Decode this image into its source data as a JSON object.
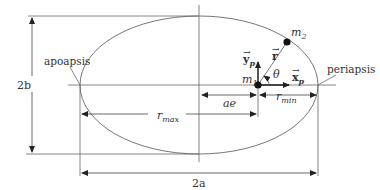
{
  "diagram": {
    "labels": {
      "apoapsis": "apoapsis",
      "periapsis": "periapsis",
      "two_b": "2b",
      "two_a": "2a",
      "ae": "ae",
      "r_max_base": "r",
      "r_max_sub": "max",
      "r_min_base": "r",
      "r_min_sub": "min",
      "m1_base": "m",
      "m1_sub": "1",
      "m2_base": "m",
      "m2_sub": "2",
      "r_vec": "r",
      "x_p_base": "x",
      "x_p_sub": "p",
      "y_p_base": "y",
      "y_p_sub": "p",
      "theta": "θ"
    },
    "colors": {
      "line": "#555555",
      "ink": "#111111"
    }
  }
}
